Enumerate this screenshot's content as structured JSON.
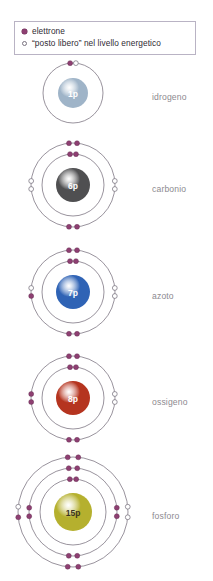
{
  "legend": {
    "rows": [
      {
        "symbol": "filled-dot",
        "text": "elettrone"
      },
      {
        "symbol": "open-circle",
        "text": "“posto libero” nel livello energetico"
      }
    ]
  },
  "colors": {
    "electron": "#8e3f72",
    "empty_slot": "#ffffff",
    "orbit": "#6d6472",
    "label_text": "#8d8a90",
    "legend_border": "#b9b3c4"
  },
  "atoms": [
    {
      "name": "idrogeno",
      "nucleus_label": "1p",
      "nucleus_color": "#9fb4c8",
      "nucleus_radius": 15,
      "shells": [
        {
          "radius": 30,
          "electrons": 1,
          "empty": 1
        }
      ]
    },
    {
      "name": "carbonio",
      "nucleus_label": "6p",
      "nucleus_color": "#4f4f51",
      "nucleus_radius": 17,
      "shells": [
        {
          "radius": 31,
          "electrons": 2,
          "empty": 0
        },
        {
          "radius": 42,
          "electrons": 4,
          "empty": 4
        }
      ]
    },
    {
      "name": "azoto",
      "nucleus_label": "7p",
      "nucleus_color": "#2f63b5",
      "nucleus_radius": 17,
      "shells": [
        {
          "radius": 31,
          "electrons": 2,
          "empty": 0
        },
        {
          "radius": 42,
          "electrons": 5,
          "empty": 3
        }
      ]
    },
    {
      "name": "ossigeno",
      "nucleus_label": "8p",
      "nucleus_color": "#b5341f",
      "nucleus_radius": 17,
      "shells": [
        {
          "radius": 31,
          "electrons": 2,
          "empty": 0
        },
        {
          "radius": 42,
          "electrons": 6,
          "empty": 2
        }
      ]
    },
    {
      "name": "fosforo",
      "nucleus_label": "15p",
      "nucleus_color": "#b5b02e",
      "nucleus_radius": 19,
      "shells": [
        {
          "radius": 33,
          "electrons": 2,
          "empty": 0
        },
        {
          "radius": 44,
          "electrons": 8,
          "empty": 0
        },
        {
          "radius": 55,
          "electrons": 5,
          "empty": 3
        }
      ]
    }
  ]
}
